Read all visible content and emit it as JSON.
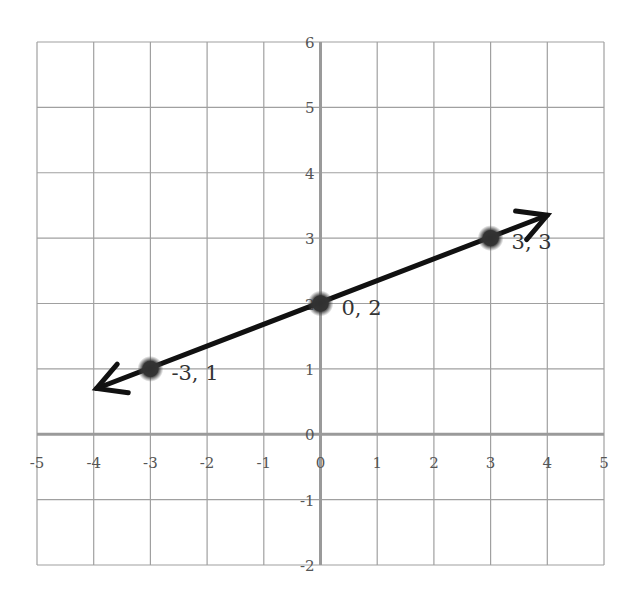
{
  "chart_data": {
    "type": "line",
    "title": "",
    "xlabel": "",
    "ylabel": "",
    "xlim": [
      -5,
      5
    ],
    "ylim": [
      -2,
      6
    ],
    "grid": true,
    "legend": null,
    "x_ticks": [
      "-5",
      "-4",
      "-3",
      "-2",
      "-1",
      "0",
      "1",
      "2",
      "3",
      "4",
      "5"
    ],
    "y_ticks": [
      "-2",
      "-1",
      "0",
      "1",
      "2",
      "3",
      "4",
      "5",
      "6"
    ],
    "points": [
      {
        "x": -3,
        "y": 1,
        "label": "-3, 1"
      },
      {
        "x": 0,
        "y": 2,
        "label": "0, 2"
      },
      {
        "x": 3,
        "y": 3,
        "label": "3, 3"
      }
    ],
    "line": {
      "equation": "y = x/3 + 2",
      "start": {
        "x": -3.95,
        "y": 0.7
      },
      "end": {
        "x": 4.0,
        "y": 3.35
      },
      "arrows": "both"
    },
    "colors": {
      "grid": "#a0a0a0",
      "axis": "#9a9a9a",
      "line": "#111111",
      "point": "#333333"
    }
  }
}
